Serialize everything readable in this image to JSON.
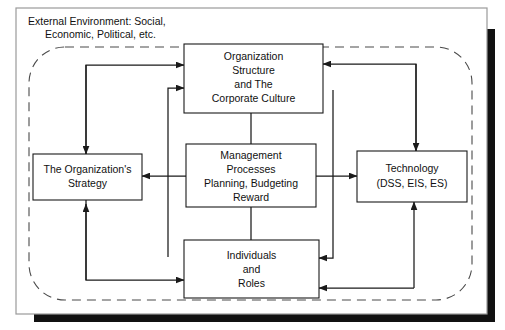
{
  "figure": {
    "type": "diagram",
    "diagram_kind": "organizational-framework-block-diagram",
    "environment_label_line1": "External Environment: Social,",
    "environment_label_line2": "Economic, Political, etc.",
    "colors": {
      "background": "#ffffff",
      "box_fill": "#ffffff",
      "stroke": "#1a1a1a",
      "boundary_stroke": "#4a4a4a",
      "frame_stroke": "#9a9a9a",
      "shadow": "#111111"
    },
    "nodes": [
      {
        "id": "organization-structure",
        "lines": [
          "Organization",
          "Structure",
          "and The",
          "Corporate Culture"
        ]
      },
      {
        "id": "organization-strategy",
        "lines": [
          "The Organization's",
          "Strategy"
        ]
      },
      {
        "id": "management-processes",
        "lines": [
          "Management",
          "Processes",
          "Planning, Budgeting",
          "Reward"
        ]
      },
      {
        "id": "technology",
        "lines": [
          "Technology",
          "(DSS, EIS, ES)"
        ]
      },
      {
        "id": "individuals-roles",
        "lines": [
          "Individuals",
          "and",
          "Roles"
        ]
      }
    ],
    "edges": [
      {
        "from": "organization-strategy",
        "to": "organization-structure",
        "style": "double-headed-elbow-left"
      },
      {
        "from": "organization-structure",
        "to": "technology",
        "style": "double-headed-elbow-right"
      },
      {
        "from": "organization-strategy",
        "to": "individuals-roles",
        "style": "double-headed-elbow-bottom-left"
      },
      {
        "from": "individuals-roles",
        "to": "technology",
        "style": "double-headed-elbow-bottom-right"
      },
      {
        "from": "individuals-roles",
        "to": "organization-structure",
        "style": "elbow-left-inner"
      },
      {
        "from": "organization-structure",
        "to": "individuals-roles",
        "style": "elbow-right-inner"
      },
      {
        "from": "management-processes",
        "to": "organization-structure",
        "style": "vertical-plain"
      },
      {
        "from": "management-processes",
        "to": "individuals-roles",
        "style": "vertical-plain"
      },
      {
        "from": "management-processes",
        "to": "organization-strategy",
        "style": "arrow-left"
      },
      {
        "from": "management-processes",
        "to": "technology",
        "style": "arrow-right"
      }
    ]
  }
}
